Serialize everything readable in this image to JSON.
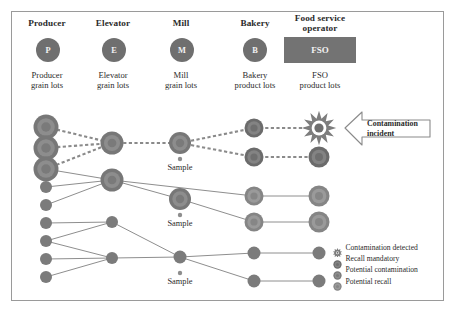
{
  "diagram": {
    "columns": [
      {
        "id": "producer",
        "header": "Producer",
        "badge": "P",
        "badge_shape": "circle",
        "sub": "Producer\ngrain lots"
      },
      {
        "id": "elevator",
        "header": "Elevator",
        "badge": "E",
        "badge_shape": "circle",
        "sub": "Elevator\ngrain lots"
      },
      {
        "id": "mill",
        "header": "Mill",
        "badge": "M",
        "badge_shape": "circle",
        "sub": "Mill\ngrain lots"
      },
      {
        "id": "bakery",
        "header": "Bakery",
        "badge": "B",
        "badge_shape": "circle",
        "sub": "Bakery\nproduct lots"
      },
      {
        "id": "fso",
        "header": "Food service\noperator",
        "badge": "FSO",
        "badge_shape": "rect",
        "sub": "FSO\nproduct lots"
      }
    ],
    "callout": {
      "label": "Contamination\nincident",
      "shape": "left-arrow"
    },
    "sample_labels": [
      "Sample",
      "Sample",
      "Sample"
    ],
    "legend": {
      "items": [
        {
          "icon": "starburst-node",
          "label": "Contamination detected",
          "state": "contamination_detected"
        },
        {
          "icon": "ring-node-dark",
          "label": "Recall mandatory",
          "state": "recall_mandatory"
        },
        {
          "icon": "ring-node-mid",
          "label": "Potential contamination",
          "state": "potential_contamination"
        },
        {
          "icon": "ring-node-light",
          "label": "Potential recall",
          "state": "potential_recall"
        }
      ]
    },
    "colors": {
      "node_fill": "#7d7d7d",
      "node_ring": "#616161",
      "node_inner": "#8c8c8c",
      "badge": "#6f6f6f",
      "badge_rect": "#737373",
      "line": "#8e8e8e",
      "line_dashed": "#8a8a8a",
      "frame": "#9a9a9a",
      "text": "#2b2b2b",
      "callout_stroke": "#8a8a8a"
    }
  },
  "chart_data": {
    "type": "diagram",
    "stages": [
      "Producer",
      "Elevator",
      "Mill",
      "Bakery",
      "Food service operator"
    ],
    "stage_x": [
      46,
      112,
      180,
      254,
      319
    ],
    "nodes": [
      {
        "id": "P1",
        "stage": "producer",
        "x": 46,
        "y": 127,
        "r": 12.5,
        "style": "ring",
        "state": "potential_contamination"
      },
      {
        "id": "P2",
        "stage": "producer",
        "x": 46,
        "y": 148,
        "r": 12.5,
        "style": "ring",
        "state": "potential_contamination"
      },
      {
        "id": "P3",
        "stage": "producer",
        "x": 46,
        "y": 169,
        "r": 12.5,
        "style": "ring",
        "state": "potential_contamination"
      },
      {
        "id": "P4",
        "stage": "producer",
        "x": 46,
        "y": 187,
        "r": 6,
        "style": "plain",
        "state": "none"
      },
      {
        "id": "P5",
        "stage": "producer",
        "x": 46,
        "y": 205,
        "r": 6,
        "style": "plain",
        "state": "none"
      },
      {
        "id": "P6",
        "stage": "producer",
        "x": 46,
        "y": 223,
        "r": 6,
        "style": "plain",
        "state": "none"
      },
      {
        "id": "P7",
        "stage": "producer",
        "x": 46,
        "y": 241,
        "r": 6,
        "style": "plain",
        "state": "none"
      },
      {
        "id": "P8",
        "stage": "producer",
        "x": 46,
        "y": 259,
        "r": 6,
        "style": "plain",
        "state": "none"
      },
      {
        "id": "P9",
        "stage": "producer",
        "x": 46,
        "y": 277,
        "r": 6,
        "style": "plain",
        "state": "none"
      },
      {
        "id": "E1",
        "stage": "elevator",
        "x": 112,
        "y": 143,
        "r": 11.5,
        "style": "ring",
        "state": "potential_contamination"
      },
      {
        "id": "E2",
        "stage": "elevator",
        "x": 112,
        "y": 180,
        "r": 11.5,
        "style": "ring",
        "state": "potential_contamination"
      },
      {
        "id": "E3",
        "stage": "elevator",
        "x": 112,
        "y": 222,
        "r": 6,
        "style": "plain",
        "state": "none"
      },
      {
        "id": "E4",
        "stage": "elevator",
        "x": 112,
        "y": 258,
        "r": 6,
        "style": "plain",
        "state": "none"
      },
      {
        "id": "M1",
        "stage": "mill",
        "x": 180,
        "y": 143,
        "r": 11,
        "style": "ring",
        "state": "potential_contamination",
        "sample": true
      },
      {
        "id": "M2",
        "stage": "mill",
        "x": 180,
        "y": 199,
        "r": 11,
        "style": "ring",
        "state": "potential_contamination",
        "sample": true
      },
      {
        "id": "M3",
        "stage": "mill",
        "x": 180,
        "y": 257,
        "r": 6.5,
        "style": "plain",
        "state": "none",
        "sample": true
      },
      {
        "id": "B1",
        "stage": "bakery",
        "x": 254,
        "y": 128,
        "r": 9.5,
        "style": "ring",
        "state": "recall_mandatory"
      },
      {
        "id": "B2",
        "stage": "bakery",
        "x": 254,
        "y": 157,
        "r": 9.5,
        "style": "ring",
        "state": "recall_mandatory"
      },
      {
        "id": "B3",
        "stage": "bakery",
        "x": 254,
        "y": 196,
        "r": 9.5,
        "style": "ring",
        "state": "potential_recall"
      },
      {
        "id": "B4",
        "stage": "bakery",
        "x": 254,
        "y": 222,
        "r": 9.5,
        "style": "ring",
        "state": "potential_recall"
      },
      {
        "id": "B5",
        "stage": "bakery",
        "x": 254,
        "y": 253,
        "r": 6.5,
        "style": "plain",
        "state": "none"
      },
      {
        "id": "B6",
        "stage": "bakery",
        "x": 254,
        "y": 281,
        "r": 6.5,
        "style": "plain",
        "state": "none"
      },
      {
        "id": "F1",
        "stage": "fso",
        "x": 319,
        "y": 128,
        "r": 10,
        "style": "starburst",
        "state": "contamination_detected"
      },
      {
        "id": "F2",
        "stage": "fso",
        "x": 319,
        "y": 157,
        "r": 10.5,
        "style": "ring",
        "state": "recall_mandatory"
      },
      {
        "id": "F3",
        "stage": "fso",
        "x": 319,
        "y": 196,
        "r": 10.5,
        "style": "ring",
        "state": "potential_recall"
      },
      {
        "id": "F4",
        "stage": "fso",
        "x": 319,
        "y": 222,
        "r": 10.5,
        "style": "ring",
        "state": "potential_recall"
      },
      {
        "id": "F5",
        "stage": "fso",
        "x": 319,
        "y": 253,
        "r": 6.5,
        "style": "plain",
        "state": "none"
      },
      {
        "id": "F6",
        "stage": "fso",
        "x": 319,
        "y": 281,
        "r": 6.5,
        "style": "plain",
        "state": "none"
      }
    ],
    "links": [
      {
        "from": "P1",
        "to": "E1",
        "style": "dashed"
      },
      {
        "from": "P2",
        "to": "E1",
        "style": "dashed"
      },
      {
        "from": "P3",
        "to": "E1",
        "style": "dashed"
      },
      {
        "from": "P3",
        "to": "E2",
        "style": "solid"
      },
      {
        "from": "P4",
        "to": "E2",
        "style": "solid"
      },
      {
        "from": "P5",
        "to": "E2",
        "style": "solid"
      },
      {
        "from": "P6",
        "to": "E3",
        "style": "solid"
      },
      {
        "from": "P7",
        "to": "E3",
        "style": "solid"
      },
      {
        "from": "P7",
        "to": "E4",
        "style": "solid"
      },
      {
        "from": "P8",
        "to": "E4",
        "style": "solid"
      },
      {
        "from": "P9",
        "to": "E4",
        "style": "solid"
      },
      {
        "from": "E1",
        "to": "M1",
        "style": "dashed"
      },
      {
        "from": "E2",
        "to": "M2",
        "style": "solid"
      },
      {
        "from": "E2",
        "to": "B3",
        "style": "solid"
      },
      {
        "from": "E3",
        "to": "M3",
        "style": "solid"
      },
      {
        "from": "E4",
        "to": "M3",
        "style": "solid"
      },
      {
        "from": "M1",
        "to": "B1",
        "style": "dashed"
      },
      {
        "from": "M1",
        "to": "B2",
        "style": "dashed"
      },
      {
        "from": "M2",
        "to": "B4",
        "style": "solid"
      },
      {
        "from": "M3",
        "to": "B5",
        "style": "solid"
      },
      {
        "from": "M3",
        "to": "B6",
        "style": "solid"
      },
      {
        "from": "B1",
        "to": "F1",
        "style": "dashed"
      },
      {
        "from": "B2",
        "to": "F2",
        "style": "dashed"
      },
      {
        "from": "B3",
        "to": "F3",
        "style": "solid"
      },
      {
        "from": "B4",
        "to": "F4",
        "style": "solid"
      },
      {
        "from": "B5",
        "to": "F5",
        "style": "solid"
      },
      {
        "from": "B6",
        "to": "F6",
        "style": "solid"
      }
    ],
    "annotations": [
      {
        "text": "Contamination incident",
        "target": "F1",
        "position": "right"
      },
      {
        "text": "Sample",
        "target": "M1",
        "position": "below"
      },
      {
        "text": "Sample",
        "target": "M2",
        "position": "below"
      },
      {
        "text": "Sample",
        "target": "M3",
        "position": "below"
      }
    ]
  }
}
